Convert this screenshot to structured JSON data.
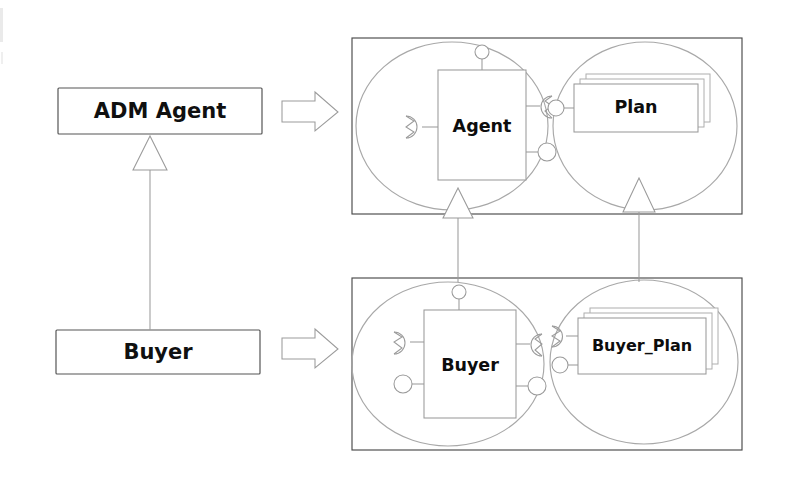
{
  "diagram": {
    "kind": "uml-component-refinement-diagram",
    "background_color": "#ffffff",
    "line_color": "#4a4a4a",
    "faint_line_color": "#a8a8a8",
    "text_color": "#101010",
    "abstract_classes": [
      {
        "id": "adm-agent",
        "label": "ADM Agent",
        "x": 58,
        "y": 88,
        "w": 204,
        "h": 46
      },
      {
        "id": "buyer",
        "label": "Buyer",
        "x": 56,
        "y": 330,
        "w": 204,
        "h": 44
      }
    ],
    "generalization_left": {
      "from": "buyer",
      "to": "adm-agent",
      "arrowhead": "hollow-triangle",
      "direction": "up"
    },
    "refinement_arrows": [
      {
        "id": "refine-agent",
        "from": "adm-agent",
        "to": "agent-composite",
        "style": "open-block-arrow"
      },
      {
        "id": "refine-buyer",
        "from": "buyer",
        "to": "buyer-composite",
        "style": "open-block-arrow"
      }
    ],
    "composites": [
      {
        "id": "agent-composite",
        "frame": {
          "x": 352,
          "y": 38,
          "w": 390,
          "h": 176
        },
        "parts": [
          {
            "id": "agent-part",
            "label": "Agent",
            "box": {
              "x": 438,
              "y": 70,
              "w": 88,
              "h": 110
            },
            "ellipse": {
              "cx": 452,
              "cy": 126,
              "rx": 96,
              "ry": 84
            },
            "ports": [
              {
                "name": "top-ball-port",
                "kind": "provided-ball",
                "side": "top"
              },
              {
                "name": "left-socket-port",
                "kind": "required-socket",
                "side": "left"
              },
              {
                "name": "right-socket-port",
                "kind": "required-socket",
                "side": "right"
              },
              {
                "name": "right-ball-port",
                "kind": "provided-ball",
                "side": "right"
              }
            ]
          },
          {
            "id": "plan-part",
            "label": "Plan",
            "stack_count": 3,
            "box": {
              "x": 574,
              "y": 84,
              "w": 124,
              "h": 48
            },
            "ellipse": {
              "cx": 645,
              "cy": 126,
              "rx": 92,
              "ry": 84
            },
            "ports": [
              {
                "name": "left-ball-port",
                "kind": "provided-ball",
                "side": "left"
              }
            ]
          }
        ]
      },
      {
        "id": "buyer-composite",
        "frame": {
          "x": 352,
          "y": 278,
          "w": 390,
          "h": 172
        },
        "parts": [
          {
            "id": "buyer-part",
            "label": "Buyer",
            "box": {
              "x": 424,
              "y": 310,
              "w": 92,
              "h": 108
            },
            "ellipse": {
              "cx": 448,
              "cy": 364,
              "rx": 96,
              "ry": 82
            },
            "ports": [
              {
                "name": "top-ball-port",
                "kind": "provided-ball",
                "side": "top"
              },
              {
                "name": "left-socket-port",
                "kind": "required-socket",
                "side": "left"
              },
              {
                "name": "left-ball-port",
                "kind": "provided-ball",
                "side": "left"
              },
              {
                "name": "right-socket-port",
                "kind": "required-socket",
                "side": "right"
              },
              {
                "name": "right-ball-port",
                "kind": "provided-ball",
                "side": "right"
              }
            ]
          },
          {
            "id": "buyer-plan-part",
            "label": "Buyer_Plan",
            "stack_count": 3,
            "box": {
              "x": 578,
              "y": 318,
              "w": 128,
              "h": 56
            },
            "ellipse": {
              "cx": 644,
              "cy": 362,
              "rx": 94,
              "ry": 82
            },
            "ports": [
              {
                "name": "left-socket-port",
                "kind": "required-socket",
                "side": "left"
              },
              {
                "name": "left-ball-port",
                "kind": "provided-ball",
                "side": "left"
              }
            ]
          }
        ]
      }
    ],
    "generalizations_right": [
      {
        "id": "gen-buyer-to-agent",
        "from": "buyer-part",
        "to": "agent-part",
        "arrowhead": "hollow-triangle",
        "direction": "up",
        "x": 458
      },
      {
        "id": "gen-buyerplan-to-plan",
        "from": "buyer-plan-part",
        "to": "plan-part",
        "arrowhead": "hollow-triangle",
        "direction": "up",
        "x": 639
      }
    ]
  }
}
